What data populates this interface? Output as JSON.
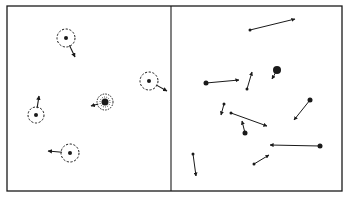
{
  "colors": {
    "ink": "#1a1a1a",
    "background": "#ffffff"
  },
  "frame": {
    "x": 7,
    "y": 6,
    "width": 335,
    "height": 185,
    "divider_x": 171
  },
  "left_panel": {
    "description": "particles surrounded by dashed clouds with short velocity arrows",
    "particles": [
      {
        "cx": 66,
        "cy": 38,
        "r": 9,
        "arrow": {
          "x2": 75,
          "y2": 57
        }
      },
      {
        "cx": 149,
        "cy": 81,
        "r": 9,
        "arrow": {
          "x2": 167,
          "y2": 91
        }
      },
      {
        "cx": 36,
        "cy": 115,
        "r": 8,
        "arrow": {
          "x2": 39,
          "y2": 96
        }
      },
      {
        "cx": 70,
        "cy": 153,
        "r": 9,
        "arrow": {
          "x2": 48,
          "y2": 151
        }
      },
      {
        "cx": 105,
        "cy": 102,
        "r": 8,
        "dense": true,
        "arrow": {
          "x2": 91,
          "y2": 106
        }
      }
    ]
  },
  "right_panel": {
    "description": "point particles with long velocity vectors",
    "vectors": [
      {
        "x1": 250,
        "y1": 30,
        "x2": 295,
        "y2": 19,
        "dot": 1.5
      },
      {
        "x1": 206,
        "y1": 83,
        "x2": 239,
        "y2": 80,
        "dot": 2.5
      },
      {
        "x1": 247,
        "y1": 89,
        "x2": 252,
        "y2": 72,
        "dot": 1.5
      },
      {
        "x1": 277,
        "y1": 70,
        "x2": 272,
        "y2": 79,
        "dot": 4
      },
      {
        "x1": 310,
        "y1": 100,
        "x2": 294,
        "y2": 120,
        "dot": 2.5
      },
      {
        "x1": 224,
        "y1": 104,
        "x2": 221,
        "y2": 115,
        "dot": 1.5
      },
      {
        "x1": 231,
        "y1": 113,
        "x2": 267,
        "y2": 126,
        "dot": 1.5
      },
      {
        "x1": 245,
        "y1": 133,
        "x2": 242,
        "y2": 121,
        "dot": 2.5
      },
      {
        "x1": 320,
        "y1": 146,
        "x2": 270,
        "y2": 145,
        "dot": 2.5
      },
      {
        "x1": 193,
        "y1": 154,
        "x2": 196,
        "y2": 176,
        "dot": 1.5
      },
      {
        "x1": 254,
        "y1": 164,
        "x2": 269,
        "y2": 155,
        "dot": 1.5
      }
    ]
  }
}
